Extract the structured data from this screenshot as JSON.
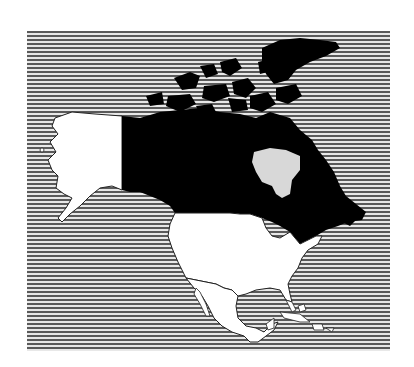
{
  "map": {
    "title": "North America",
    "style": "black-and-white hatched ocean",
    "colors": {
      "ocean_stripe_dark": "#5a5a5a",
      "ocean_stripe_light": "#e8e8e8",
      "highlighted_region": "#000000",
      "other_land": "#ffffff",
      "outline": "#222222"
    },
    "regions": [
      {
        "name": "Canada",
        "fill": "black",
        "highlighted": true
      },
      {
        "name": "Alaska",
        "fill": "white",
        "highlighted": false
      },
      {
        "name": "United States",
        "fill": "white",
        "highlighted": false
      },
      {
        "name": "Mexico",
        "fill": "white",
        "highlighted": false
      },
      {
        "name": "Caribbean islands",
        "fill": "white",
        "highlighted": false
      }
    ]
  }
}
